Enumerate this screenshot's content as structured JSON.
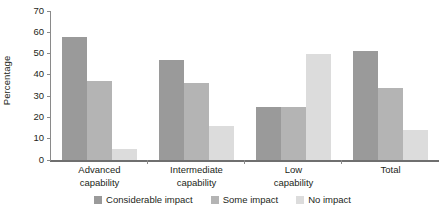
{
  "chart_data": {
    "type": "bar",
    "title": "",
    "subtitle": "",
    "xlabel": "",
    "ylabel": "Percentage",
    "ylim": [
      0,
      70
    ],
    "yticks": [
      0,
      10,
      20,
      30,
      40,
      50,
      60,
      70
    ],
    "ytick_labels": [
      "0",
      "10",
      "20",
      "30",
      "40",
      "50",
      "60",
      "70"
    ],
    "grid": false,
    "legend_position": "bottom",
    "categories": [
      "Advanced\ncapability",
      "Intermediate\ncapability",
      "Low\ncapability",
      "Total"
    ],
    "category_lines": [
      [
        "Advanced",
        "capability"
      ],
      [
        "Intermediate",
        "capability"
      ],
      [
        "Low",
        "capability"
      ],
      [
        "Total",
        ""
      ]
    ],
    "series": [
      {
        "name": "Considerable impact",
        "color": "#9a9a9a",
        "values": [
          58,
          47,
          25,
          51
        ]
      },
      {
        "name": "Some impact",
        "color": "#b4b4b4",
        "values": [
          37,
          36,
          25,
          34
        ]
      },
      {
        "name": "No impact",
        "color": "#dcdcdc",
        "values": [
          5,
          16,
          50,
          14
        ]
      }
    ]
  },
  "axis": {
    "y_label": "Percentage",
    "ticks": [
      "70",
      "60",
      "50",
      "40",
      "30",
      "20",
      "10",
      "0"
    ]
  },
  "categories": [
    {
      "line1": "Advanced",
      "line2": "capability"
    },
    {
      "line1": "Intermediate",
      "line2": "capability"
    },
    {
      "line1": "Low",
      "line2": "capability"
    },
    {
      "line1": "Total",
      "line2": ""
    }
  ],
  "legend": {
    "items": [
      {
        "label": "Considerable impact",
        "color": "#9a9a9a"
      },
      {
        "label": "Some impact",
        "color": "#b4b4b4"
      },
      {
        "label": "No impact",
        "color": "#dcdcdc"
      }
    ]
  }
}
